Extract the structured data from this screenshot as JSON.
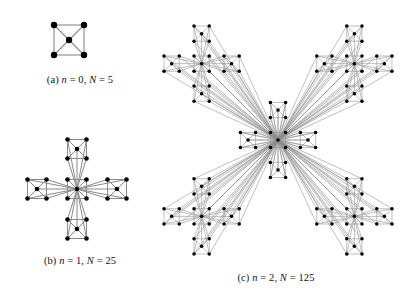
{
  "figure": {
    "kind": "hierarchical-network-diagram",
    "background_color": "#ffffff",
    "node_color": "#000000",
    "edge_color": "#8a8a8a",
    "caption_color": "#141414"
  },
  "panels": [
    {
      "id": "a",
      "label": "(a)",
      "caption": "(a) n = 0, N = 5",
      "caption_prefix": "(a) ",
      "n_symbol": "n",
      "n_value": "= 0,",
      "N_symbol": "N",
      "N_value": "= 5",
      "generation": 0,
      "node_count": 5,
      "description": "single 5-node motif: four corner nodes of a square plus one central node"
    },
    {
      "id": "b",
      "label": "(b)",
      "caption": "(b) n = 1, N = 25",
      "caption_prefix": "(b) ",
      "n_symbol": "n",
      "n_value": "= 1,",
      "N_symbol": "N",
      "N_value": "= 25",
      "generation": 1,
      "node_count": 25,
      "description": "five 5-node motifs arranged as a plus/cross, hub motif linked to every peripheral node"
    },
    {
      "id": "c",
      "label": "(c)",
      "caption": "(c) n = 2, N = 125",
      "caption_prefix": "(c) ",
      "n_symbol": "n",
      "n_value": "= 2,",
      "N_symbol": "N",
      "N_value": "= 125",
      "generation": 2,
      "node_count": 125,
      "description": "five generation-1 clusters in an X arrangement around a central cluster, hub linked to all peripheral hubs"
    }
  ],
  "chart_data": {
    "type": "diagram",
    "series": [
      {
        "name": "generation n",
        "values": [
          0,
          1,
          2
        ]
      },
      {
        "name": "node count N",
        "values": [
          5,
          25,
          125
        ]
      }
    ],
    "categories": [
      "(a)",
      "(b)",
      "(c)"
    ],
    "growth_rule": "N = 5^(n+1)",
    "legend": "none",
    "grid": false
  },
  "geometry": {
    "motif_offsets": [
      [
        -1,
        -1
      ],
      [
        1,
        -1
      ],
      [
        1,
        1
      ],
      [
        -1,
        1
      ],
      [
        0,
        0
      ]
    ],
    "panel_a": {
      "cx": 69,
      "cy": 32,
      "radius": 15,
      "dot": 6.4
    },
    "panel_b": {
      "cx": 77,
      "cy": 61,
      "arm": 40,
      "radius": 9.5,
      "dot": 4.6
    },
    "panel_c": {
      "cx": 138,
      "cy": 138,
      "arm": 108,
      "sub_arm": 30,
      "radius": 7.6,
      "dot": 3.5
    }
  }
}
